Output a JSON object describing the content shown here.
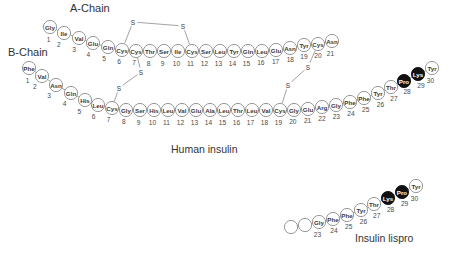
{
  "figure": {
    "labels": {
      "a_chain": "A-Chain",
      "b_chain": "B-Chain",
      "human_insulin": "Human insulin",
      "insulin_lispro": "Insulin lispro"
    },
    "disulfide_atom_label": "S",
    "colors": {
      "background": "#ffffff",
      "circle_fill": "#ffffff",
      "circle_stroke": "#8c8c8c",
      "highlight_fill": "#111111",
      "highlight_text": "#ffffff",
      "text": "#3a3a3a"
    }
  },
  "human_insulin": {
    "a_chain": {
      "name": "A-Chain",
      "residues": [
        {
          "n": 1,
          "aa": "Gly",
          "x": 50,
          "y": 27,
          "hl": false
        },
        {
          "n": 2,
          "aa": "Ile",
          "x": 64,
          "y": 33,
          "hl": false
        },
        {
          "n": 3,
          "aa": "Val",
          "x": 79,
          "y": 38,
          "hl": false
        },
        {
          "n": 4,
          "aa": "Glu",
          "x": 93,
          "y": 43,
          "hl": false
        },
        {
          "n": 5,
          "aa": "Gln",
          "x": 108,
          "y": 47,
          "hl": false
        },
        {
          "n": 6,
          "aa": "Cys",
          "x": 122,
          "y": 50,
          "hl": false
        },
        {
          "n": 7,
          "aa": "Cys",
          "x": 136,
          "y": 51,
          "hl": false
        },
        {
          "n": 8,
          "aa": "Thr",
          "x": 150,
          "y": 51,
          "hl": false
        },
        {
          "n": 9,
          "aa": "Ser",
          "x": 164,
          "y": 51,
          "hl": false
        },
        {
          "n": 10,
          "aa": "Ile",
          "x": 178,
          "y": 51,
          "hl": false
        },
        {
          "n": 11,
          "aa": "Cys",
          "x": 192,
          "y": 51,
          "hl": false
        },
        {
          "n": 12,
          "aa": "Ser",
          "x": 206,
          "y": 51,
          "hl": false
        },
        {
          "n": 13,
          "aa": "Leu",
          "x": 220,
          "y": 51,
          "hl": false
        },
        {
          "n": 14,
          "aa": "Tyr",
          "x": 234,
          "y": 51,
          "hl": false
        },
        {
          "n": 15,
          "aa": "Gln",
          "x": 248,
          "y": 51,
          "hl": false
        },
        {
          "n": 16,
          "aa": "Leu",
          "x": 262,
          "y": 51,
          "hl": false
        },
        {
          "n": 17,
          "aa": "Glu",
          "x": 276,
          "y": 50,
          "hl": false
        },
        {
          "n": 18,
          "aa": "Asn",
          "x": 290,
          "y": 48,
          "hl": false
        },
        {
          "n": 19,
          "aa": "Tyr",
          "x": 304,
          "y": 45,
          "hl": false
        },
        {
          "n": 20,
          "aa": "Cys",
          "x": 318,
          "y": 44,
          "hl": false
        },
        {
          "n": 21,
          "aa": "Asn",
          "x": 332,
          "y": 41,
          "hl": false
        }
      ]
    },
    "b_chain": {
      "name": "B-Chain",
      "residues": [
        {
          "n": 1,
          "aa": "Phe",
          "x": 29,
          "y": 68,
          "hl": false
        },
        {
          "n": 2,
          "aa": "Val",
          "x": 42,
          "y": 76,
          "hl": false
        },
        {
          "n": 3,
          "aa": "Asn",
          "x": 56,
          "y": 85,
          "hl": false
        },
        {
          "n": 4,
          "aa": "Gln",
          "x": 71,
          "y": 93,
          "hl": false
        },
        {
          "n": 5,
          "aa": "His",
          "x": 85,
          "y": 100,
          "hl": false
        },
        {
          "n": 6,
          "aa": "Leu",
          "x": 98,
          "y": 105,
          "hl": false
        },
        {
          "n": 7,
          "aa": "Cys",
          "x": 112,
          "y": 108,
          "hl": false
        },
        {
          "n": 8,
          "aa": "Gly",
          "x": 126,
          "y": 110,
          "hl": false
        },
        {
          "n": 9,
          "aa": "Ser",
          "x": 140,
          "y": 110,
          "hl": false
        },
        {
          "n": 10,
          "aa": "His",
          "x": 154,
          "y": 110,
          "hl": false
        },
        {
          "n": 11,
          "aa": "Leu",
          "x": 168,
          "y": 110,
          "hl": false
        },
        {
          "n": 12,
          "aa": "Val",
          "x": 182,
          "y": 110,
          "hl": false
        },
        {
          "n": 13,
          "aa": "Glu",
          "x": 196,
          "y": 110,
          "hl": false
        },
        {
          "n": 14,
          "aa": "Ala",
          "x": 210,
          "y": 110,
          "hl": false
        },
        {
          "n": 15,
          "aa": "Leu",
          "x": 224,
          "y": 110,
          "hl": false
        },
        {
          "n": 16,
          "aa": "Thr",
          "x": 238,
          "y": 110,
          "hl": false
        },
        {
          "n": 17,
          "aa": "Leu",
          "x": 252,
          "y": 110,
          "hl": false
        },
        {
          "n": 18,
          "aa": "Val",
          "x": 266,
          "y": 110,
          "hl": false
        },
        {
          "n": 19,
          "aa": "Cys",
          "x": 280,
          "y": 110,
          "hl": false
        },
        {
          "n": 20,
          "aa": "Gly",
          "x": 294,
          "y": 110,
          "hl": false
        },
        {
          "n": 21,
          "aa": "Glu",
          "x": 308,
          "y": 109,
          "hl": false
        },
        {
          "n": 22,
          "aa": "Arg",
          "x": 322,
          "y": 107,
          "hl": false
        },
        {
          "n": 23,
          "aa": "Gly",
          "x": 336,
          "y": 105,
          "hl": false
        },
        {
          "n": 24,
          "aa": "Phe",
          "x": 350,
          "y": 102,
          "hl": false
        },
        {
          "n": 25,
          "aa": "Phe",
          "x": 364,
          "y": 98,
          "hl": false
        },
        {
          "n": 26,
          "aa": "Tyr",
          "x": 378,
          "y": 93,
          "hl": false
        },
        {
          "n": 27,
          "aa": "Thr",
          "x": 391,
          "y": 87,
          "hl": false
        },
        {
          "n": 28,
          "aa": "Pro",
          "x": 404,
          "y": 81,
          "hl": true
        },
        {
          "n": 29,
          "aa": "Lys",
          "x": 418,
          "y": 74,
          "hl": true
        },
        {
          "n": 30,
          "aa": "Tyr",
          "x": 432,
          "y": 68,
          "hl": false
        }
      ]
    },
    "disulfide_bonds": [
      {
        "id": "A6-A11",
        "from": [
          122,
          50
        ],
        "to": [
          192,
          51
        ],
        "s1": [
          133,
          22
        ],
        "s2": [
          183,
          26
        ]
      },
      {
        "id": "A7-B7",
        "from": [
          136,
          51
        ],
        "to": [
          112,
          108
        ],
        "s1": [
          141,
          72
        ],
        "s2": [
          119,
          88
        ]
      },
      {
        "id": "A20-B19",
        "from": [
          318,
          44
        ],
        "to": [
          280,
          110
        ],
        "s1": [
          308,
          67
        ],
        "s2": [
          288,
          85
        ]
      }
    ],
    "caption": "Human insulin"
  },
  "insulin_lispro": {
    "residues": [
      {
        "n": 23,
        "aa": "Gly",
        "x": 319,
        "y": 222,
        "hl": false
      },
      {
        "n": 24,
        "aa": "Phe",
        "x": 333,
        "y": 219,
        "hl": false
      },
      {
        "n": 25,
        "aa": "Phe",
        "x": 347,
        "y": 215,
        "hl": false
      },
      {
        "n": 26,
        "aa": "Tyr",
        "x": 361,
        "y": 210,
        "hl": false
      },
      {
        "n": 27,
        "aa": "Thr",
        "x": 374,
        "y": 204,
        "hl": false
      },
      {
        "n": 28,
        "aa": "Lys",
        "x": 388,
        "y": 198,
        "hl": true
      },
      {
        "n": 29,
        "aa": "Pro",
        "x": 402,
        "y": 192,
        "hl": true
      },
      {
        "n": 30,
        "aa": "Tyr",
        "x": 416,
        "y": 186,
        "hl": false
      }
    ],
    "truncated_residues": [
      {
        "x": 291,
        "y": 227
      },
      {
        "x": 305,
        "y": 225
      }
    ],
    "caption": "Insulin lispro"
  }
}
